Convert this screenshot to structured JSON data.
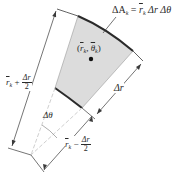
{
  "diagram": {
    "type": "polar-area-element",
    "colors": {
      "sector_fill": "#dcdcdc",
      "arc_stroke": "#2a2a2a",
      "line": "#3a3a3a",
      "dashed": "#cfcfcf",
      "centroid": "#111111"
    },
    "labels": {
      "area_formula": "ΔA",
      "area_sub": "k",
      "area_eq": " = ",
      "area_rbar": "r",
      "area_rbar_sub": "k",
      "area_rest": " Δr Δθ",
      "centroid_open": "(",
      "centroid_r": "r",
      "centroid_r_sub": "k",
      "centroid_comma": ", ",
      "centroid_theta": "θ",
      "centroid_theta_sub": "k",
      "centroid_close": ")",
      "outer_radius_r": "r",
      "outer_radius_sub": "k",
      "outer_radius_op": " + ",
      "outer_radius_num": "Δr",
      "outer_radius_den": "2",
      "inner_radius_r": "r",
      "inner_radius_sub": "k",
      "inner_radius_op": " − ",
      "inner_radius_num": "Δr",
      "inner_radius_den": "2",
      "delta_r": "Δr",
      "delta_theta": "Δθ"
    }
  }
}
